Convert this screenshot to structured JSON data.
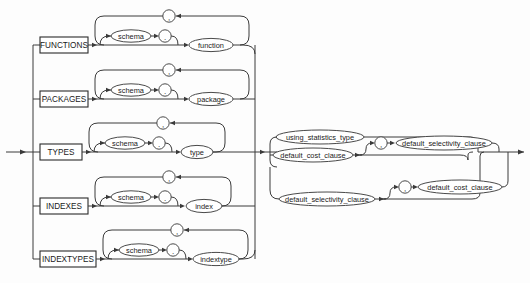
{
  "diagram": {
    "name": "statistics_type_clause",
    "type": "railroad-syntax-diagram",
    "entry_arrow": "entry",
    "exit_arrow": "exit",
    "colors": {
      "background": "#fdfdfd",
      "line": "#3a3a3a",
      "keyword_border": "#2b2b2b",
      "nonterminal_border": "#4a4a4a",
      "text": "#1a1a1a"
    },
    "keywords": [
      {
        "id": "functions",
        "label": "FUNCTIONS"
      },
      {
        "id": "packages",
        "label": "PACKAGES"
      },
      {
        "id": "types",
        "label": "TYPES"
      },
      {
        "id": "indexes",
        "label": "INDEXES"
      },
      {
        "id": "indextypes",
        "label": "INDEXTYPES"
      }
    ],
    "branches": [
      {
        "id": "functions-branch",
        "keyword": "FUNCTIONS",
        "schema": "schema",
        "dot": ".",
        "item": "function",
        "separator": ","
      },
      {
        "id": "packages-branch",
        "keyword": "PACKAGES",
        "schema": "schema",
        "dot": ".",
        "item": "package",
        "separator": ","
      },
      {
        "id": "types-branch",
        "keyword": "TYPES",
        "schema": "schema",
        "dot": ".",
        "item": "type",
        "separator": ","
      },
      {
        "id": "indexes-branch",
        "keyword": "INDEXES",
        "schema": "schema",
        "dot": ".",
        "item": "index",
        "separator": ","
      },
      {
        "id": "indextypes-branch",
        "keyword": "INDEXTYPES",
        "schema": "schema",
        "dot": ".",
        "item": "indextype",
        "separator": ","
      }
    ],
    "right_alternatives": [
      {
        "id": "alt-using-statistics-type",
        "label": "using_statistics_type"
      },
      {
        "id": "alt-default-cost-clause",
        "label": "default_cost_clause",
        "separator": ",",
        "optional_follow": "default_selectivity_clause"
      },
      {
        "id": "alt-default-selectivity-clause",
        "label": "default_selectivity_clause",
        "separator": ",",
        "optional_follow": "default_cost_clause"
      }
    ],
    "labels": {
      "schema": "schema",
      "dot": ".",
      "comma": ",",
      "function": "function",
      "package": "package",
      "type": "type",
      "index": "index",
      "indextype": "indextype",
      "using_statistics_type": "using_statistics_type",
      "default_cost_clause": "default_cost_clause",
      "default_selectivity_clause": "default_selectivity_clause"
    }
  }
}
